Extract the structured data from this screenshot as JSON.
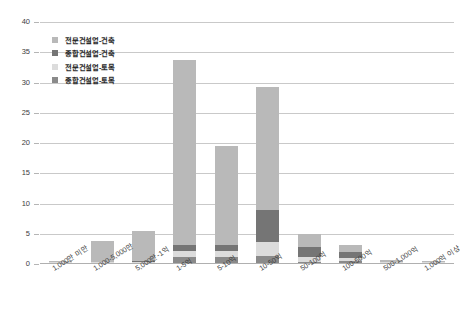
{
  "chart_data": {
    "type": "bar",
    "stacked": true,
    "title": "",
    "subtitle": "",
    "xlabel": "",
    "ylabel": "",
    "ylim": [
      0,
      40
    ],
    "yticks": [
      0,
      5,
      10,
      15,
      20,
      25,
      30,
      35,
      40
    ],
    "ytick_labels": [
      "0",
      "5",
      "10",
      "15",
      "20",
      "25",
      "30",
      "35",
      "40"
    ],
    "grid": true,
    "legend_position": "top-left",
    "categories": [
      "1,000만 미만",
      "1,000-5,000만",
      "5,000만-1억",
      "1-5억",
      "5-10억",
      "10-50억",
      "50-100억",
      "100-500억",
      "500-1,000억",
      "1,000억 이상"
    ],
    "series": [
      {
        "name": "전문건설업-건축",
        "color": "#b9b9b9",
        "values": [
          0.3,
          3.4,
          4.9,
          30.5,
          16.3,
          20.3,
          2.1,
          1.1,
          0.2,
          0.15
        ]
      },
      {
        "name": "종합건설업-건축",
        "color": "#757575",
        "values": [
          0.0,
          0.1,
          0.2,
          1.1,
          1.1,
          5.3,
          1.6,
          1.0,
          0.1,
          0.05
        ]
      },
      {
        "name": "전문건설업-토목",
        "color": "#dcdcdc",
        "values": [
          0.1,
          0.15,
          0.2,
          1.0,
          1.0,
          2.3,
          0.8,
          0.5,
          0.05,
          0.05
        ]
      },
      {
        "name": "종합건설업-토목",
        "color": "#8a8a8a",
        "values": [
          0.05,
          0.1,
          0.1,
          1.1,
          1.1,
          1.3,
          0.4,
          0.5,
          0.05,
          0.05
        ]
      }
    ],
    "stack_order_bottom_to_top": [
      "종합건설업-토목",
      "전문건설업-토목",
      "종합건설업-건축",
      "전문건설업-건축"
    ],
    "totals": [
      0.45,
      3.75,
      5.4,
      33.7,
      19.5,
      29.2,
      4.9,
      3.1,
      0.4,
      0.3
    ]
  },
  "legend": {
    "items": [
      {
        "label": "전문건설업-건축",
        "color": "#b9b9b9"
      },
      {
        "label": "종합건설업-건축",
        "color": "#757575"
      },
      {
        "label": "전문건설업-토목",
        "color": "#dcdcdc"
      },
      {
        "label": "종합건설업-토목",
        "color": "#8a8a8a"
      }
    ]
  }
}
